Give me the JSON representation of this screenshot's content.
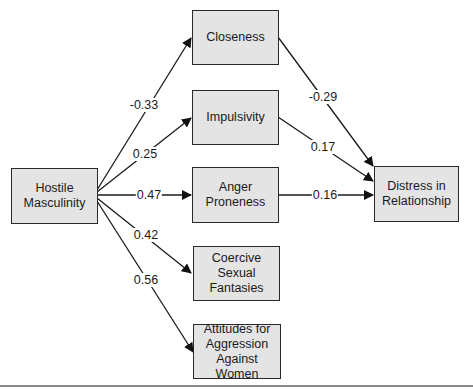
{
  "diagram": {
    "type": "path-diagram",
    "nodes": {
      "hostile": "Hostile\nMasculinity",
      "closeness": "Closeness",
      "impulsivity": "Impulsivity",
      "anger": "Anger\nProneness",
      "coercive": "Coercive\nSexual\nFantasies",
      "attitudes": "Attitudes for\nAggression\nAgainst Women",
      "distress": "Distress in\nRelationship"
    },
    "edges": [
      {
        "from": "hostile",
        "to": "closeness",
        "coef": "-0.33"
      },
      {
        "from": "hostile",
        "to": "impulsivity",
        "coef": "0.25"
      },
      {
        "from": "hostile",
        "to": "anger",
        "coef": "0.47"
      },
      {
        "from": "hostile",
        "to": "coercive",
        "coef": "0.42"
      },
      {
        "from": "hostile",
        "to": "attitudes",
        "coef": "0.56"
      },
      {
        "from": "closeness",
        "to": "distress",
        "coef": "-0.29"
      },
      {
        "from": "impulsivity",
        "to": "distress",
        "coef": "0.17"
      },
      {
        "from": "anger",
        "to": "distress",
        "coef": "0.16"
      }
    ]
  }
}
